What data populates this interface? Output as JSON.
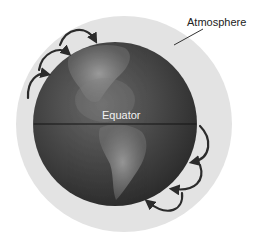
{
  "diagram": {
    "labels": {
      "atmosphere": "Atmosphere",
      "equator": "Equator"
    },
    "colors": {
      "atmosphere": "#e2e2e2",
      "earth_dark": "#2e2e2e",
      "earth_mid": "#5a5a5a",
      "land": "#9a9a9a",
      "arrow": "#2b2b2b",
      "equator_line": "#1a1a1a"
    },
    "arrows": {
      "northern_hemisphere_count": 3,
      "southern_hemisphere_count": 3
    }
  }
}
